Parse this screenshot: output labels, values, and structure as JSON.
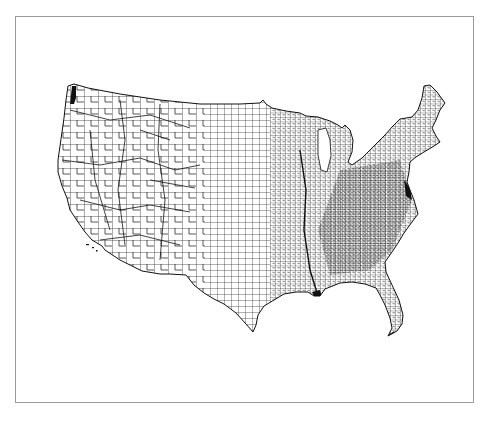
{
  "figure": {
    "caption_fragment": "",
    "caption_note": "caption line above the figure is clipped at the top edge; only descenders visible"
  },
  "map": {
    "subject": "United States county boundaries",
    "region": "Contiguous United States (lower 48)",
    "style": {
      "fill_color": "#ffffff",
      "line_color": "#111111",
      "frame_color": "#9a9a9a",
      "background": "#ffffff"
    },
    "features": [
      {
        "name": "Puget Sound",
        "note": "dense dark cluster at northwest tip"
      },
      {
        "name": "Great Lakes",
        "note": "Lake Michigan shown as white gap"
      },
      {
        "name": "Chesapeake Bay",
        "note": "dense dark area on east coast"
      },
      {
        "name": "Florida peninsula",
        "note": "southeast extension with keys"
      },
      {
        "name": "Mississippi delta",
        "note": "dark cluster on gulf coast"
      }
    ]
  }
}
